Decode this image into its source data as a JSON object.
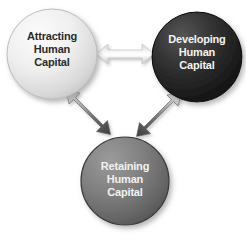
{
  "diagram": {
    "background_color": "#ffffff",
    "nodes": [
      {
        "id": "attracting",
        "lines": [
          "Attracting",
          "Human",
          "Capital"
        ],
        "line1": "Attracting",
        "line2": "Human",
        "line3": "Capital",
        "shape": "circle",
        "fill_light": "#f3f3f3",
        "fill_dark": "#c9c9c9",
        "rim_color": "#b8b8b8",
        "text_color": "#2b2b2b",
        "center_x": 52,
        "center_y": 54,
        "radius": 45
      },
      {
        "id": "developing",
        "lines": [
          "Developing",
          "Human",
          "Capital"
        ],
        "line1": "Developing",
        "line2": "Human",
        "line3": "Capital",
        "shape": "circle",
        "fill_light": "#4a4a4a",
        "fill_dark": "#121212",
        "rim_color": "#0a0a0a",
        "text_color": "#f4f4f4",
        "center_x": 197,
        "center_y": 57,
        "radius": 45
      },
      {
        "id": "retaining",
        "lines": [
          "Retaining",
          "Human",
          "Capital"
        ],
        "line1": "Retaining",
        "line2": "Human",
        "line3": "Capital",
        "shape": "circle",
        "fill_light": "#8d8d8d",
        "fill_dark": "#5a5a5a",
        "rim_color": "#3d3d3d",
        "text_color": "#f2f2f2",
        "center_x": 125,
        "center_y": 181,
        "radius": 44
      }
    ],
    "connectors": [
      {
        "id": "attracting-developing",
        "from": "attracting",
        "to": "developing",
        "style": "double-headed-arrow",
        "orientation": "horizontal",
        "fill_light": "#ffffff",
        "fill_dark": "#cfcfcf"
      },
      {
        "id": "attracting-retaining",
        "from": "attracting",
        "to": "retaining",
        "style": "double-headed-arrow",
        "orientation": "diagonal-down-right",
        "fill_light": "#d6d6d6",
        "fill_dark": "#4e4e4e"
      },
      {
        "id": "developing-retaining",
        "from": "developing",
        "to": "retaining",
        "style": "double-headed-arrow",
        "orientation": "diagonal-down-left",
        "fill_light": "#d6d6d6",
        "fill_dark": "#4e4e4e"
      }
    ]
  }
}
